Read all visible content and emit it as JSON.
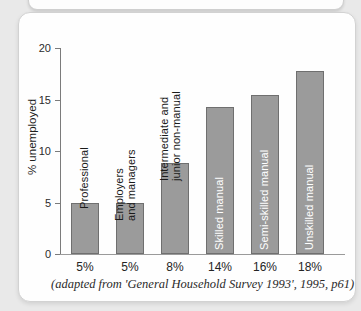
{
  "chart_data": {
    "type": "bar",
    "title": "",
    "xlabel": "",
    "ylabel": "% unemployed",
    "ylim": [
      0,
      20
    ],
    "yticks": [
      "0",
      "5",
      "10",
      "15",
      "20"
    ],
    "grid": false,
    "legend": false,
    "bar_color": "#9b9b9b",
    "bar_border_color": "#6f6f6f",
    "categories": [
      "Professional",
      "Employers and managers",
      "Intermediate and junior non-manual",
      "Skilled manual",
      "Semi-skilled manual",
      "Unskilled manual"
    ],
    "values": [
      5.0,
      5.0,
      8.8,
      14.3,
      15.4,
      17.8
    ],
    "tick_labels": [
      "5%",
      "5%",
      "8%",
      "14%",
      "16%",
      "18%"
    ],
    "bars": [
      {
        "category": "Professional",
        "value": 5.0,
        "tick_label": "5%",
        "label_line1": "Professional",
        "label_line2": "",
        "label_position": "outside"
      },
      {
        "category": "Employers and managers",
        "value": 5.0,
        "tick_label": "5%",
        "label_line1": "Employers",
        "label_line2": "and managers",
        "label_position": "outside"
      },
      {
        "category": "Intermediate and junior non-manual",
        "value": 8.8,
        "tick_label": "8%",
        "label_line1": "Intermediate and",
        "label_line2": "junior non-manual",
        "label_position": "outside"
      },
      {
        "category": "Skilled manual",
        "value": 14.3,
        "tick_label": "14%",
        "label_line1": "Skilled manual",
        "label_line2": "",
        "label_position": "inside"
      },
      {
        "category": "Semi-skilled manual",
        "value": 15.4,
        "tick_label": "16%",
        "label_line1": "Semi-skilled manual",
        "label_line2": "",
        "label_position": "inside"
      },
      {
        "category": "Unskilled manual",
        "value": 17.8,
        "tick_label": "18%",
        "label_line1": "Unskilled manual",
        "label_line2": "",
        "label_position": "inside"
      }
    ]
  },
  "caption": "(adapted from 'General Household Survey 1993', 1995, p61)"
}
